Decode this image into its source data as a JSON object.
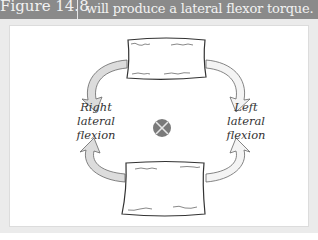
{
  "header": {
    "figure_label": "Figure 14.8",
    "caption": "will produce a lateral flexor torque."
  },
  "diagram": {
    "labels": {
      "right": [
        "Right",
        "lateral",
        "flexion"
      ],
      "left": [
        "Left",
        "lateral",
        "flexion"
      ]
    },
    "center_symbol": "axis-into-page",
    "colors": {
      "header_bg": "#8a8a8a",
      "panel_bg": "#ebebeb",
      "arrow_fill": "#d9d9d9",
      "axis_circle": "#7a7a7a",
      "outline": "#333333"
    }
  }
}
